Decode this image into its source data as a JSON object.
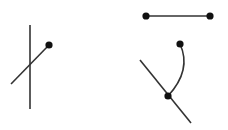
{
  "canvas": {
    "width": 228,
    "height": 130,
    "background": "#ffffff"
  },
  "colors": {
    "stroke": "#333333",
    "point": "#111111"
  },
  "figures": [
    {
      "id": "crossing-lines",
      "vertical_line": {
        "x1": 30,
        "y1": 25,
        "x2": 30,
        "y2": 109
      },
      "diagonal_line": {
        "x1": 11,
        "y1": 84,
        "x2": 49,
        "y2": 45
      },
      "points": [
        {
          "cx": 49,
          "cy": 45
        }
      ]
    },
    {
      "id": "segment",
      "line": {
        "x1": 146,
        "y1": 16,
        "x2": 210,
        "y2": 16
      },
      "points": [
        {
          "cx": 146,
          "cy": 16
        },
        {
          "cx": 210,
          "cy": 16
        }
      ]
    },
    {
      "id": "arc-and-line",
      "diagonal_line": {
        "x1": 140,
        "y1": 60,
        "x2": 191,
        "y2": 123
      },
      "arc_path": "M180 44 Q192 70 168 96",
      "points": [
        {
          "cx": 180,
          "cy": 44
        },
        {
          "cx": 168,
          "cy": 96
        }
      ]
    }
  ]
}
